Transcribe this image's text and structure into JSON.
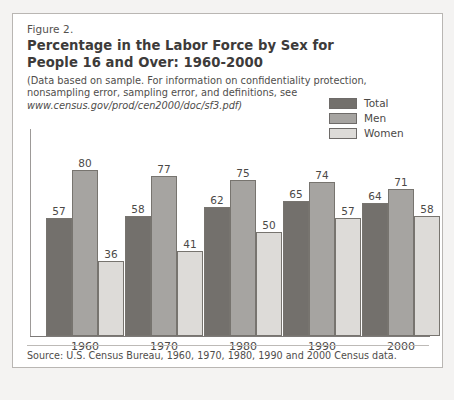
{
  "figure": {
    "number": "Figure 2.",
    "title_lines": [
      "Percentage in the Labor Force by Sex for",
      "People 16 and Over: 1960-2000"
    ],
    "note_lines": [
      "(Data based on sample.  For information on confidentiality protection,",
      "nonsampling error, sampling error, and definitions, see"
    ],
    "note_url": "www.census.gov/prod/cen2000/doc/sf3.pdf)",
    "source": "Source: U.S. Census Bureau, 1960, 1970, 1980, 1990 and 2000 Census data."
  },
  "legend": {
    "items": [
      {
        "label": "Total",
        "color": "#73706c"
      },
      {
        "label": "Men",
        "color": "#a6a4a1"
      },
      {
        "label": "Women",
        "color": "#dddbd8"
      }
    ]
  },
  "chart_data": {
    "type": "bar",
    "title": "Percentage in the Labor Force by Sex for People 16 and Over: 1960-2000",
    "xlabel": "",
    "ylabel": "",
    "ylim": [
      0,
      80
    ],
    "grid": false,
    "legend_position": "top-right",
    "categories": [
      "1960",
      "1970",
      "1980",
      "1990",
      "2000"
    ],
    "series": [
      {
        "name": "Total",
        "color": "#73706c",
        "values": [
          57,
          58,
          62,
          65,
          64
        ]
      },
      {
        "name": "Men",
        "color": "#a6a4a1",
        "values": [
          80,
          77,
          75,
          74,
          71
        ]
      },
      {
        "name": "Women",
        "color": "#dddbd8",
        "values": [
          36,
          41,
          50,
          57,
          58
        ]
      }
    ]
  }
}
